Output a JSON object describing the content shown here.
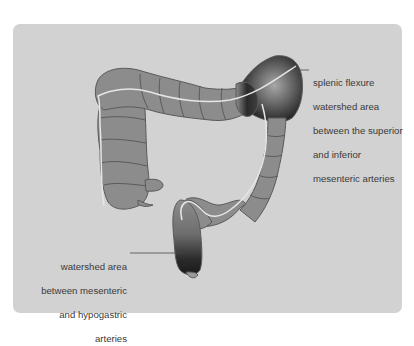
{
  "figure": {
    "background_color": "#d2d2d2",
    "colon_fill": "#8c8c8c",
    "colon_outline": "#5a5a5a",
    "centerline_color": "#e6e6e6",
    "ischemic_shading": "#1e1e1e"
  },
  "annotations": {
    "splenic": {
      "line1": "splenic flexure",
      "line2": "watershed area",
      "line3": "between the superior",
      "line4": "and inferior",
      "line5": "mesenteric arteries"
    },
    "rectosigmoid": {
      "line1": "watershed area",
      "line2": "between mesenteric",
      "line3": "and hypogastric",
      "line4": "arteries"
    }
  }
}
